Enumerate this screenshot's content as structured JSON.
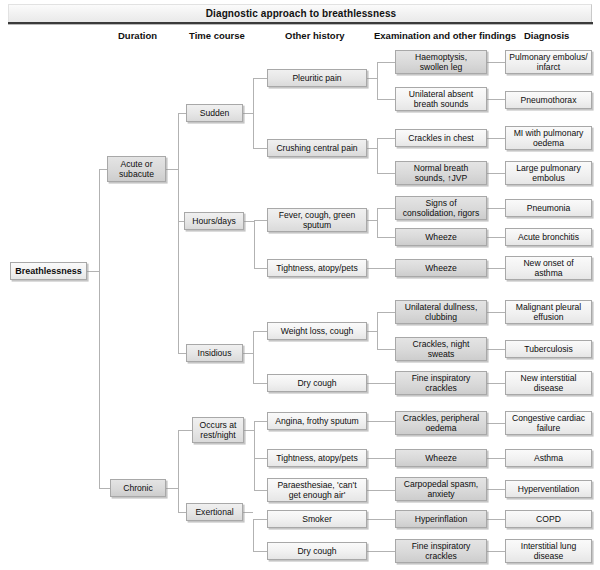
{
  "title": "Diagnostic approach to breathlessness",
  "columns": [
    {
      "label": "Duration",
      "x": 118
    },
    {
      "label": "Time course",
      "x": 189
    },
    {
      "label": "Other history",
      "x": 285
    },
    {
      "label": "Examination and other findings",
      "x": 374
    },
    {
      "label": "Diagnosis",
      "x": 524
    }
  ],
  "root": {
    "label": "Breathlessness",
    "x": 10,
    "y": 262,
    "w": 77,
    "h": 18,
    "shade": "sh-light"
  },
  "duration": [
    {
      "label": "Acute or\nsubacute",
      "x": 107,
      "y": 156,
      "w": 59,
      "h": 26,
      "shade": "sh-dark"
    },
    {
      "label": "Chronic",
      "x": 110,
      "y": 479,
      "w": 56,
      "h": 18,
      "shade": "sh-dark"
    }
  ],
  "timecourse": [
    {
      "label": "Sudden",
      "x": 186,
      "y": 104,
      "w": 57,
      "h": 18,
      "shade": "sh-mid"
    },
    {
      "label": "Hours/days",
      "x": 184,
      "y": 212,
      "w": 60,
      "h": 18,
      "shade": "sh-mid"
    },
    {
      "label": "Insidious",
      "x": 186,
      "y": 344,
      "w": 57,
      "h": 18,
      "shade": "sh-mid"
    },
    {
      "label": "Occurs at\nrest/night",
      "x": 192,
      "y": 417,
      "w": 52,
      "h": 26,
      "shade": "sh-mid"
    },
    {
      "label": "Exertional",
      "x": 186,
      "y": 503,
      "w": 57,
      "h": 18,
      "shade": "sh-mid"
    }
  ],
  "history": [
    {
      "label": "Pleuritic pain",
      "x": 267,
      "y": 69,
      "w": 100,
      "h": 18,
      "shade": "sh-mid"
    },
    {
      "label": "Crushing central pain",
      "x": 267,
      "y": 139,
      "w": 100,
      "h": 18,
      "shade": "sh-mid"
    },
    {
      "label": "Fever, cough, green\nsputum",
      "x": 267,
      "y": 208,
      "w": 100,
      "h": 24,
      "shade": "sh-mid"
    },
    {
      "label": "Tightness, atopy/pets",
      "x": 267,
      "y": 259,
      "w": 100,
      "h": 18,
      "shade": "sh-light"
    },
    {
      "label": "Weight loss, cough",
      "x": 267,
      "y": 322,
      "w": 100,
      "h": 18,
      "shade": "sh-light"
    },
    {
      "label": "Dry cough",
      "x": 267,
      "y": 374,
      "w": 100,
      "h": 18,
      "shade": "sh-light"
    },
    {
      "label": "Angina, frothy sputum",
      "x": 267,
      "y": 412,
      "w": 100,
      "h": 18,
      "shade": "sh-light"
    },
    {
      "label": "Tightness, atopy/pets",
      "x": 267,
      "y": 449,
      "w": 100,
      "h": 18,
      "shade": "sh-light"
    },
    {
      "label": "Paraesthesiae, 'can't\nget enough air'",
      "x": 267,
      "y": 478,
      "w": 100,
      "h": 24,
      "shade": "sh-light"
    },
    {
      "label": "Smoker",
      "x": 267,
      "y": 510,
      "w": 100,
      "h": 18,
      "shade": "sh-light"
    },
    {
      "label": "Dry cough",
      "x": 267,
      "y": 542,
      "w": 100,
      "h": 18,
      "shade": "sh-light"
    }
  ],
  "examination": [
    {
      "label": "Haemoptysis,\nswollen leg",
      "x": 395,
      "y": 50,
      "w": 92,
      "h": 24,
      "shade": "sh-dark"
    },
    {
      "label": "Unilateral absent\nbreath sounds",
      "x": 395,
      "y": 87,
      "w": 92,
      "h": 24,
      "shade": "sh-light"
    },
    {
      "label": "Crackles in chest",
      "x": 395,
      "y": 129,
      "w": 92,
      "h": 18,
      "shade": "sh-light"
    },
    {
      "label": "Normal breath\nsounds, ↑JVP",
      "x": 395,
      "y": 161,
      "w": 92,
      "h": 24,
      "shade": "sh-dark"
    },
    {
      "label": "Signs of\nconsolidation, rigors",
      "x": 395,
      "y": 196,
      "w": 92,
      "h": 24,
      "shade": "sh-dark"
    },
    {
      "label": "Wheeze",
      "x": 395,
      "y": 228,
      "w": 92,
      "h": 18,
      "shade": "sh-dark"
    },
    {
      "label": "Wheeze",
      "x": 395,
      "y": 259,
      "w": 92,
      "h": 18,
      "shade": "sh-dark"
    },
    {
      "label": "Unilateral dullness,\nclubbing",
      "x": 395,
      "y": 300,
      "w": 92,
      "h": 24,
      "shade": "sh-dark"
    },
    {
      "label": "Crackles, night\nsweats",
      "x": 395,
      "y": 337,
      "w": 92,
      "h": 24,
      "shade": "sh-dark"
    },
    {
      "label": "Fine inspiratory\ncrackles",
      "x": 395,
      "y": 371,
      "w": 92,
      "h": 24,
      "shade": "sh-dark"
    },
    {
      "label": "Crackles, peripheral\noedema",
      "x": 395,
      "y": 411,
      "w": 92,
      "h": 24,
      "shade": "sh-dark"
    },
    {
      "label": "Wheeze",
      "x": 395,
      "y": 449,
      "w": 92,
      "h": 18,
      "shade": "sh-dark"
    },
    {
      "label": "Carpopedal spasm,\nanxiety",
      "x": 395,
      "y": 477,
      "w": 92,
      "h": 24,
      "shade": "sh-dark"
    },
    {
      "label": "Hyperinflation",
      "x": 395,
      "y": 510,
      "w": 92,
      "h": 18,
      "shade": "sh-dark"
    },
    {
      "label": "Fine inspiratory\ncrackles",
      "x": 395,
      "y": 539,
      "w": 92,
      "h": 24,
      "shade": "sh-dark"
    }
  ],
  "diagnosis": [
    {
      "label": "Pulmonary embolus/\ninfarct",
      "x": 505,
      "y": 50,
      "w": 87,
      "h": 24,
      "shade": "sh-light"
    },
    {
      "label": "Pneumothorax",
      "x": 505,
      "y": 91,
      "w": 87,
      "h": 18,
      "shade": "sh-light"
    },
    {
      "label": "MI with pulmonary\noedema",
      "x": 505,
      "y": 126,
      "w": 87,
      "h": 24,
      "shade": "sh-light"
    },
    {
      "label": "Large pulmonary\nembolus",
      "x": 505,
      "y": 161,
      "w": 87,
      "h": 24,
      "shade": "sh-light"
    },
    {
      "label": "Pneumonia",
      "x": 505,
      "y": 199,
      "w": 87,
      "h": 18,
      "shade": "sh-light"
    },
    {
      "label": "Acute bronchitis",
      "x": 505,
      "y": 228,
      "w": 87,
      "h": 18,
      "shade": "sh-light"
    },
    {
      "label": "New onset of\nasthma",
      "x": 505,
      "y": 256,
      "w": 87,
      "h": 24,
      "shade": "sh-light"
    },
    {
      "label": "Malignant pleural\neffusion",
      "x": 505,
      "y": 300,
      "w": 87,
      "h": 24,
      "shade": "sh-light"
    },
    {
      "label": "Tuberculosis",
      "x": 505,
      "y": 340,
      "w": 87,
      "h": 18,
      "shade": "sh-light"
    },
    {
      "label": "New interstitial\ndisease",
      "x": 505,
      "y": 371,
      "w": 87,
      "h": 24,
      "shade": "sh-light"
    },
    {
      "label": "Congestive cardiac\nfailure",
      "x": 505,
      "y": 411,
      "w": 87,
      "h": 24,
      "shade": "sh-light"
    },
    {
      "label": "Asthma",
      "x": 505,
      "y": 449,
      "w": 87,
      "h": 18,
      "shade": "sh-light"
    },
    {
      "label": "Hyperventilation",
      "x": 505,
      "y": 480,
      "w": 87,
      "h": 18,
      "shade": "sh-light"
    },
    {
      "label": "COPD",
      "x": 505,
      "y": 510,
      "w": 87,
      "h": 18,
      "shade": "sh-light"
    },
    {
      "label": "Interstitial lung\ndisease",
      "x": 505,
      "y": 539,
      "w": 87,
      "h": 24,
      "shade": "sh-light"
    }
  ],
  "connectors": [
    {
      "o": "h",
      "x": 87,
      "y": 271,
      "l": 12
    },
    {
      "o": "v",
      "x": 99,
      "y": 169,
      "l": 319
    },
    {
      "o": "h",
      "x": 99,
      "y": 169,
      "l": 8
    },
    {
      "o": "h",
      "x": 99,
      "y": 488,
      "l": 11
    },
    {
      "o": "h",
      "x": 166,
      "y": 169,
      "l": 12
    },
    {
      "o": "v",
      "x": 178,
      "y": 113,
      "l": 240
    },
    {
      "o": "h",
      "x": 178,
      "y": 113,
      "l": 8
    },
    {
      "o": "h",
      "x": 178,
      "y": 221,
      "l": 6
    },
    {
      "o": "h",
      "x": 178,
      "y": 353,
      "l": 8
    },
    {
      "o": "h",
      "x": 166,
      "y": 488,
      "l": 12
    },
    {
      "o": "v",
      "x": 178,
      "y": 430,
      "l": 82
    },
    {
      "o": "h",
      "x": 178,
      "y": 430,
      "l": 14
    },
    {
      "o": "h",
      "x": 178,
      "y": 512,
      "l": 8
    },
    {
      "o": "h",
      "x": 243,
      "y": 113,
      "l": 10
    },
    {
      "o": "v",
      "x": 253,
      "y": 78,
      "l": 70
    },
    {
      "o": "h",
      "x": 253,
      "y": 78,
      "l": 14
    },
    {
      "o": "h",
      "x": 253,
      "y": 148,
      "l": 14
    },
    {
      "o": "h",
      "x": 244,
      "y": 221,
      "l": 10
    },
    {
      "o": "v",
      "x": 254,
      "y": 220,
      "l": 48
    },
    {
      "o": "h",
      "x": 254,
      "y": 220,
      "l": 13
    },
    {
      "o": "h",
      "x": 254,
      "y": 268,
      "l": 13
    },
    {
      "o": "h",
      "x": 243,
      "y": 353,
      "l": 10
    },
    {
      "o": "v",
      "x": 253,
      "y": 331,
      "l": 52
    },
    {
      "o": "h",
      "x": 253,
      "y": 331,
      "l": 14
    },
    {
      "o": "h",
      "x": 253,
      "y": 383,
      "l": 14
    },
    {
      "o": "h",
      "x": 244,
      "y": 430,
      "l": 10
    },
    {
      "o": "v",
      "x": 254,
      "y": 421,
      "l": 69
    },
    {
      "o": "h",
      "x": 254,
      "y": 421,
      "l": 13
    },
    {
      "o": "h",
      "x": 254,
      "y": 458,
      "l": 13
    },
    {
      "o": "h",
      "x": 254,
      "y": 490,
      "l": 13
    },
    {
      "o": "h",
      "x": 243,
      "y": 512,
      "l": 10
    },
    {
      "o": "v",
      "x": 253,
      "y": 519,
      "l": 32
    },
    {
      "o": "h",
      "x": 253,
      "y": 519,
      "l": 14
    },
    {
      "o": "h",
      "x": 253,
      "y": 551,
      "l": 14
    },
    {
      "o": "h",
      "x": 367,
      "y": 78,
      "l": 10
    },
    {
      "o": "v",
      "x": 377,
      "y": 62,
      "l": 37
    },
    {
      "o": "h",
      "x": 377,
      "y": 62,
      "l": 18
    },
    {
      "o": "h",
      "x": 377,
      "y": 99,
      "l": 18
    },
    {
      "o": "h",
      "x": 367,
      "y": 148,
      "l": 10
    },
    {
      "o": "v",
      "x": 377,
      "y": 138,
      "l": 35
    },
    {
      "o": "h",
      "x": 377,
      "y": 138,
      "l": 18
    },
    {
      "o": "h",
      "x": 377,
      "y": 173,
      "l": 18
    },
    {
      "o": "h",
      "x": 367,
      "y": 220,
      "l": 10
    },
    {
      "o": "v",
      "x": 377,
      "y": 208,
      "l": 29
    },
    {
      "o": "h",
      "x": 377,
      "y": 208,
      "l": 18
    },
    {
      "o": "h",
      "x": 377,
      "y": 237,
      "l": 18
    },
    {
      "o": "h",
      "x": 367,
      "y": 268,
      "l": 28
    },
    {
      "o": "h",
      "x": 367,
      "y": 331,
      "l": 10
    },
    {
      "o": "v",
      "x": 377,
      "y": 312,
      "l": 37
    },
    {
      "o": "h",
      "x": 377,
      "y": 312,
      "l": 18
    },
    {
      "o": "h",
      "x": 377,
      "y": 349,
      "l": 18
    },
    {
      "o": "h",
      "x": 367,
      "y": 383,
      "l": 28
    },
    {
      "o": "h",
      "x": 367,
      "y": 421,
      "l": 28
    },
    {
      "o": "h",
      "x": 367,
      "y": 458,
      "l": 28
    },
    {
      "o": "h",
      "x": 367,
      "y": 490,
      "l": 28
    },
    {
      "o": "h",
      "x": 367,
      "y": 519,
      "l": 28
    },
    {
      "o": "h",
      "x": 367,
      "y": 551,
      "l": 28
    },
    {
      "o": "h",
      "x": 487,
      "y": 62,
      "l": 18
    },
    {
      "o": "h",
      "x": 487,
      "y": 99,
      "l": 18
    },
    {
      "o": "h",
      "x": 487,
      "y": 138,
      "l": 18
    },
    {
      "o": "h",
      "x": 487,
      "y": 173,
      "l": 18
    },
    {
      "o": "h",
      "x": 487,
      "y": 208,
      "l": 18
    },
    {
      "o": "h",
      "x": 487,
      "y": 237,
      "l": 18
    },
    {
      "o": "h",
      "x": 487,
      "y": 268,
      "l": 18
    },
    {
      "o": "h",
      "x": 487,
      "y": 312,
      "l": 18
    },
    {
      "o": "h",
      "x": 487,
      "y": 349,
      "l": 18
    },
    {
      "o": "h",
      "x": 487,
      "y": 383,
      "l": 18
    },
    {
      "o": "h",
      "x": 487,
      "y": 423,
      "l": 18
    },
    {
      "o": "h",
      "x": 487,
      "y": 458,
      "l": 18
    },
    {
      "o": "h",
      "x": 487,
      "y": 489,
      "l": 18
    },
    {
      "o": "h",
      "x": 487,
      "y": 519,
      "l": 18
    },
    {
      "o": "h",
      "x": 487,
      "y": 551,
      "l": 18
    }
  ]
}
